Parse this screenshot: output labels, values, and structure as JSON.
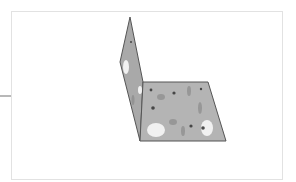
{
  "figure": {
    "colors": {
      "background": "#ffffff",
      "frame_border": "#e2e2e2",
      "side_tick": "#b8b8b8",
      "panel_fill": "#b4b4b4",
      "panel_fill_vertical": "#a9a9a9",
      "panel_edge": "#555555",
      "blob_light": "#f4f4f4",
      "blob_dark": "#3a3a3a",
      "blob_mid": "#8a8a8a"
    },
    "vertical_panel": {
      "points": "130,17 120,62 140,141 143,82"
    },
    "horizontal_panel": {
      "points": "143,82 208,82 226,141 140,141"
    },
    "light_blobs": [
      {
        "cx": 156,
        "cy": 130,
        "rx": 9,
        "ry": 7
      },
      {
        "cx": 207,
        "cy": 128,
        "rx": 6,
        "ry": 8
      },
      {
        "cx": 126,
        "cy": 67,
        "rx": 3,
        "ry": 7
      },
      {
        "cx": 140,
        "cy": 90,
        "rx": 2,
        "ry": 4
      }
    ],
    "dark_marks": [
      {
        "cx": 151,
        "cy": 90,
        "r": 1.4
      },
      {
        "cx": 174,
        "cy": 93,
        "r": 1.6
      },
      {
        "cx": 153,
        "cy": 108,
        "r": 1.8
      },
      {
        "cx": 191,
        "cy": 126,
        "r": 1.6
      },
      {
        "cx": 203,
        "cy": 128,
        "r": 1.8
      },
      {
        "cx": 201,
        "cy": 89,
        "r": 1.2
      },
      {
        "cx": 131,
        "cy": 42,
        "r": 1.0
      }
    ],
    "mid_marks": [
      {
        "cx": 161,
        "cy": 97,
        "rx": 4,
        "ry": 3
      },
      {
        "cx": 189,
        "cy": 91,
        "rx": 2,
        "ry": 5
      },
      {
        "cx": 200,
        "cy": 108,
        "rx": 2,
        "ry": 6
      },
      {
        "cx": 173,
        "cy": 122,
        "rx": 4,
        "ry": 3
      },
      {
        "cx": 183,
        "cy": 131,
        "rx": 2,
        "ry": 5
      },
      {
        "cx": 133,
        "cy": 100,
        "rx": 1.5,
        "ry": 5
      }
    ]
  }
}
